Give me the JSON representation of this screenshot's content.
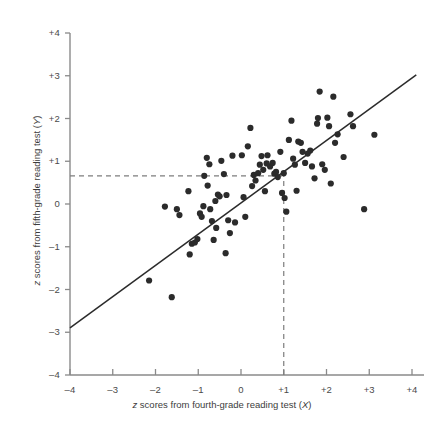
{
  "chart_data": {
    "type": "scatter",
    "title": "",
    "xlabel": "z scores from fourth-grade reading test (X)",
    "ylabel": "z scores from fifth-grade reading test (Y)",
    "xlabel_parts": {
      "italic_lead": "z",
      "rest": " scores from fourth-grade reading test (",
      "italic_var": "X",
      "tail": ")"
    },
    "ylabel_parts": {
      "italic_lead": "z",
      "rest": " scores from fifth-grade reading test (",
      "italic_var": "Y",
      "tail": ")"
    },
    "xlim": [
      -4,
      4
    ],
    "ylim": [
      -4,
      4
    ],
    "grid": false,
    "legend": null,
    "xticks": [
      -4,
      -3,
      -2,
      -1,
      0,
      1,
      2,
      3,
      4
    ],
    "yticks": [
      -4,
      -3,
      -2,
      -1,
      0,
      1,
      2,
      3,
      4
    ],
    "xtick_labels": [
      "–4",
      "–3",
      "–2",
      "–1",
      "0",
      "+1",
      "+2",
      "+3",
      "+4"
    ],
    "ytick_labels": [
      "–4",
      "–3",
      "–2",
      "–1",
      "0",
      "+1",
      "+2",
      "+3",
      "+4"
    ],
    "marker_color": "#2b2b2b",
    "line_color": "#2b2b2b",
    "guide_color": "#7d7d7d",
    "axis_color": "#8a8a8a",
    "regression_line": {
      "x1": -4.0,
      "y1": -2.9,
      "x2": 4.1,
      "y2": 3.02
    },
    "guides": {
      "horizontal_y": 0.66,
      "vertical_x": 1.0,
      "style": "dashed",
      "h_from_x": -4.0,
      "h_to_x": 1.0,
      "v_from_y": -4.0,
      "v_to_y": 0.66
    },
    "points": [
      [
        -2.15,
        -1.79
      ],
      [
        -1.78,
        -0.06
      ],
      [
        -1.62,
        -2.18
      ],
      [
        -1.5,
        -0.12
      ],
      [
        -1.44,
        -0.26
      ],
      [
        -1.23,
        0.3
      ],
      [
        -1.2,
        -1.18
      ],
      [
        -1.15,
        -0.93
      ],
      [
        -1.08,
        -0.9
      ],
      [
        -1.02,
        -0.82
      ],
      [
        -0.96,
        -0.22
      ],
      [
        -0.92,
        -0.3
      ],
      [
        -0.88,
        -0.05
      ],
      [
        -0.86,
        0.66
      ],
      [
        -0.8,
        1.08
      ],
      [
        -0.78,
        0.43
      ],
      [
        -0.74,
        0.93
      ],
      [
        -0.72,
        -0.12
      ],
      [
        -0.68,
        -0.4
      ],
      [
        -0.64,
        -0.84
      ],
      [
        -0.6,
        0.07
      ],
      [
        -0.58,
        -0.56
      ],
      [
        -0.54,
        0.22
      ],
      [
        -0.5,
        0.18
      ],
      [
        -0.46,
        1.01
      ],
      [
        -0.4,
        0.7
      ],
      [
        -0.36,
        -1.15
      ],
      [
        -0.34,
        0.21
      ],
      [
        -0.3,
        -0.38
      ],
      [
        -0.26,
        -0.68
      ],
      [
        -0.2,
        1.13
      ],
      [
        -0.14,
        -0.43
      ],
      [
        0.02,
        1.14
      ],
      [
        0.06,
        0.16
      ],
      [
        0.1,
        -0.3
      ],
      [
        0.16,
        1.35
      ],
      [
        0.22,
        1.78
      ],
      [
        0.26,
        0.42
      ],
      [
        0.3,
        0.68
      ],
      [
        0.34,
        0.55
      ],
      [
        0.4,
        0.72
      ],
      [
        0.44,
        0.92
      ],
      [
        0.48,
        1.12
      ],
      [
        0.52,
        0.8
      ],
      [
        0.56,
        0.3
      ],
      [
        0.6,
        0.95
      ],
      [
        0.62,
        1.14
      ],
      [
        0.68,
        0.88
      ],
      [
        0.74,
        0.96
      ],
      [
        0.78,
        0.71
      ],
      [
        0.82,
        0.75
      ],
      [
        0.86,
        0.63
      ],
      [
        0.92,
        1.22
      ],
      [
        0.96,
        0.26
      ],
      [
        1.0,
        0.72
      ],
      [
        1.02,
        0.14
      ],
      [
        1.06,
        -0.18
      ],
      [
        1.12,
        1.5
      ],
      [
        1.18,
        1.95
      ],
      [
        1.22,
        1.06
      ],
      [
        1.26,
        0.92
      ],
      [
        1.3,
        0.31
      ],
      [
        1.34,
        1.46
      ],
      [
        1.4,
        1.43
      ],
      [
        1.44,
        1.22
      ],
      [
        1.5,
        0.96
      ],
      [
        1.56,
        1.18
      ],
      [
        1.62,
        1.25
      ],
      [
        1.66,
        0.88
      ],
      [
        1.72,
        0.6
      ],
      [
        1.78,
        1.88
      ],
      [
        1.8,
        2.01
      ],
      [
        1.84,
        2.63
      ],
      [
        1.9,
        0.93
      ],
      [
        1.96,
        0.8
      ],
      [
        2.02,
        2.02
      ],
      [
        2.06,
        1.82
      ],
      [
        2.1,
        0.48
      ],
      [
        2.16,
        2.51
      ],
      [
        2.2,
        1.43
      ],
      [
        2.26,
        1.63
      ],
      [
        2.4,
        1.1
      ],
      [
        2.56,
        2.1
      ],
      [
        2.62,
        1.82
      ],
      [
        2.88,
        -0.12
      ],
      [
        3.12,
        1.62
      ]
    ]
  }
}
